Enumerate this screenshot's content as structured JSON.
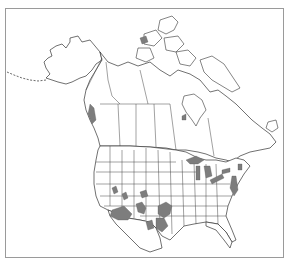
{
  "map": {
    "title": "",
    "region": "North America",
    "type": "species range map",
    "colors": {
      "background": "#ffffff",
      "outline": "#333333",
      "range_fill": "#7d7d7d",
      "frame": "#9a9a9a"
    },
    "range_areas": [
      {
        "name": "Pacific Northwest coast (British Columbia / Washington)",
        "shade": "dark"
      },
      {
        "name": "Great Lakes shorelines",
        "shade": "gray"
      },
      {
        "name": "Atlantic coast (New England to Chesapeake)",
        "shade": "dark"
      },
      {
        "name": "Southern Arizona / New Mexico",
        "shade": "gray"
      },
      {
        "name": "Western Oklahoma / Texas panhandle",
        "shade": "gray"
      },
      {
        "name": "Central Texas",
        "shade": "gray"
      },
      {
        "name": "Scattered interior patches (Great Basin, Colorado, Utah)",
        "shade": "gray"
      }
    ]
  }
}
